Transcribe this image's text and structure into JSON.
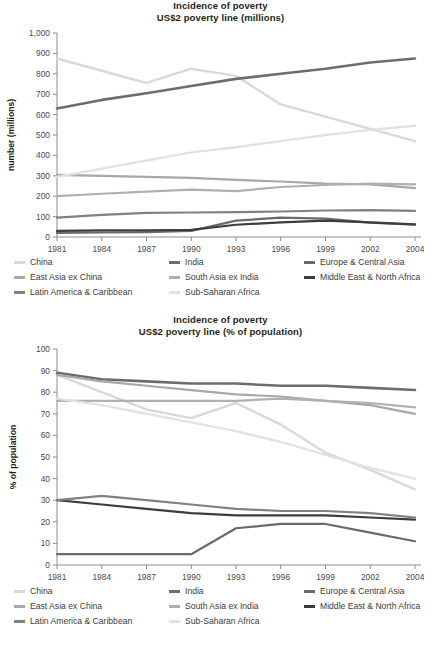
{
  "figure": {
    "name": "incidence-of-poverty-us2-poverty-line"
  },
  "legend": {
    "items": [
      {
        "label": "China",
        "color": "#d9d9d9"
      },
      {
        "label": "India",
        "color": "#6d6d6d"
      },
      {
        "label": "Europe & Central Asia",
        "color": "#6b6b6b"
      },
      {
        "label": "East Asia ex China",
        "color": "#a8a8a8"
      },
      {
        "label": "South Asia ex India",
        "color": "#b0b0b0"
      },
      {
        "label": "Middle East & North Africa",
        "color": "#3d3d3d"
      },
      {
        "label": "Latin America & Caribbean",
        "color": "#818181"
      },
      {
        "label": "Sub-Saharan Africa",
        "color": "#e2e2e2"
      }
    ]
  },
  "chart_data": [
    {
      "type": "line",
      "name": "millions-chart",
      "title": "Incidence of poverty",
      "subtitle": "US$2 poverty line (millions)",
      "xlabel": "",
      "ylabel": "number (millions)",
      "x": [
        "1981",
        "1984",
        "1987",
        "1990",
        "1993",
        "1996",
        "1999",
        "2002",
        "2004"
      ],
      "ylim": [
        0,
        1000
      ],
      "yticks": [
        0,
        100,
        200,
        300,
        400,
        500,
        600,
        700,
        800,
        900,
        1000
      ],
      "ytick_labels": [
        "0",
        "100",
        "200",
        "300",
        "400",
        "500",
        "600",
        "700",
        "800",
        "900",
        "1,000"
      ],
      "grid": false,
      "legend_position": "below",
      "series": [
        {
          "name": "China",
          "color": "#d9d9d9",
          "width": 2.4,
          "values": [
            875,
            815,
            755,
            825,
            790,
            650,
            590,
            530,
            470
          ]
        },
        {
          "name": "India",
          "color": "#6d6d6d",
          "width": 2.6,
          "values": [
            630,
            672,
            705,
            740,
            775,
            800,
            825,
            855,
            875
          ]
        },
        {
          "name": "Europe & Central Asia",
          "color": "#6b6b6b",
          "width": 2.2,
          "values": [
            20,
            22,
            24,
            30,
            80,
            95,
            90,
            70,
            60
          ]
        },
        {
          "name": "East Asia ex China",
          "color": "#a8a8a8",
          "width": 2.2,
          "values": [
            305,
            300,
            295,
            290,
            280,
            272,
            262,
            258,
            240
          ]
        },
        {
          "name": "South Asia ex India",
          "color": "#b0b0b0",
          "width": 2.2,
          "values": [
            200,
            212,
            222,
            232,
            225,
            245,
            255,
            262,
            258
          ]
        },
        {
          "name": "Middle East & North Africa",
          "color": "#3d3d3d",
          "width": 2.2,
          "values": [
            30,
            32,
            33,
            35,
            60,
            72,
            80,
            72,
            62
          ]
        },
        {
          "name": "Latin America & Caribbean",
          "color": "#818181",
          "width": 2.2,
          "values": [
            95,
            108,
            118,
            120,
            122,
            125,
            130,
            132,
            128
          ]
        },
        {
          "name": "Sub-Saharan Africa",
          "color": "#e2e2e2",
          "width": 2.4,
          "values": [
            295,
            335,
            375,
            415,
            440,
            470,
            500,
            525,
            545
          ]
        }
      ]
    },
    {
      "type": "line",
      "name": "percent-of-population-chart",
      "title": "Incidence of poverty",
      "subtitle": "US$2 poverty line (% of population)",
      "xlabel": "",
      "ylabel": "% of population",
      "x": [
        "1981",
        "1984",
        "1987",
        "1990",
        "1993",
        "1996",
        "1999",
        "2002",
        "2004"
      ],
      "ylim": [
        0,
        100
      ],
      "yticks": [
        0,
        10,
        20,
        30,
        40,
        50,
        60,
        70,
        80,
        90,
        100
      ],
      "ytick_labels": [
        "0",
        "10",
        "20",
        "30",
        "40",
        "50",
        "60",
        "70",
        "80",
        "90",
        "100"
      ],
      "grid": false,
      "legend_position": "below",
      "series": [
        {
          "name": "China",
          "color": "#d9d9d9",
          "width": 2.4,
          "values": [
            88,
            80,
            72,
            68,
            75,
            65,
            52,
            44,
            35
          ]
        },
        {
          "name": "India",
          "color": "#6d6d6d",
          "width": 2.6,
          "values": [
            89,
            86,
            85,
            84,
            84,
            83,
            83,
            82,
            81
          ]
        },
        {
          "name": "Europe & Central Asia",
          "color": "#6b6b6b",
          "width": 2.2,
          "values": [
            5,
            5,
            5,
            5,
            17,
            19,
            19,
            15,
            11
          ]
        },
        {
          "name": "East Asia ex China",
          "color": "#a8a8a8",
          "width": 2.2,
          "values": [
            88,
            85,
            83,
            81,
            79,
            78,
            76,
            74,
            70
          ]
        },
        {
          "name": "South Asia ex India",
          "color": "#b0b0b0",
          "width": 2.2,
          "values": [
            76,
            76,
            76,
            76,
            76,
            77,
            76,
            75,
            73
          ]
        },
        {
          "name": "Middle East & North Africa",
          "color": "#3d3d3d",
          "width": 2.2,
          "values": [
            30,
            28,
            26,
            24,
            23,
            23,
            23,
            22,
            21
          ]
        },
        {
          "name": "Latin America & Caribbean",
          "color": "#818181",
          "width": 2.2,
          "values": [
            30,
            32,
            30,
            28,
            26,
            25,
            25,
            24,
            22
          ]
        },
        {
          "name": "Sub-Saharan Africa",
          "color": "#e2e2e2",
          "width": 2.4,
          "values": [
            77,
            74,
            70,
            66,
            62,
            57,
            51,
            45,
            40
          ]
        }
      ]
    }
  ]
}
